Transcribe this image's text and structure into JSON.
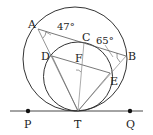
{
  "diagram": {
    "points": {
      "A": "A",
      "B": "B",
      "C": "C",
      "D": "D",
      "E": "E",
      "F": "F",
      "P": "P",
      "T": "T",
      "Q": "Q"
    },
    "angles": {
      "at_A": "47°",
      "at_B": "65°"
    },
    "colors": {
      "stroke": "#333333",
      "thin": "#666666",
      "background": "#ffffff"
    }
  }
}
